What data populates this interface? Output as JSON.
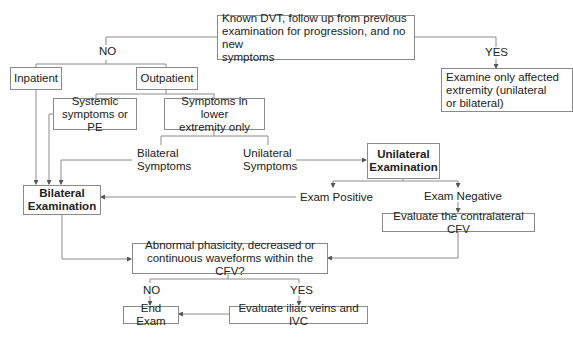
{
  "diagram": {
    "type": "flowchart",
    "nodes": {
      "start": "Known DVT, follow up from previous examination for progression, and no new symptoms",
      "inpatient": "Inpatient",
      "outpatient": "Outpatient",
      "systemic": "Systemic symptoms or PE",
      "lower_extremity": "Symptoms in lower extremity only",
      "affected_only": "Examine only affected extremity (unilateral or bilateral)",
      "unilateral_exam": "Unilateral Examination",
      "bilateral_exam": "Bilateral Examination",
      "contralateral_cfv": "Evaluate the contralateral CFV",
      "abnormal_question": "Abnormal phasicity, decreased or continuous waveforms within the CFV?",
      "end_exam": "End Exam",
      "iliac_ivc": "Evaluate iliac veins and IVC"
    },
    "labels": {
      "no_top": "NO",
      "yes_top": "YES",
      "bilateral_symptoms": "Bilateral Symptoms",
      "unilateral_symptoms": "Unilateral Symptoms",
      "exam_positive": "Exam Positive",
      "exam_negative": "Exam Negative",
      "no_bottom": "NO",
      "yes_bottom": "YES"
    },
    "lines": {
      "start_l1": "Known DVT, follow up from previous",
      "start_l2": "examination for progression, and no new",
      "start_l3": "symptoms",
      "systemic_l1": "Systemic",
      "systemic_l2": "symptoms or PE",
      "lower_l1": "Symptoms in lower",
      "lower_l2": "extremity only",
      "affected_l1": "Examine only affected",
      "affected_l2": "extremity (unilateral",
      "affected_l3": "or bilateral)",
      "uni_l1": "Unilateral",
      "uni_l2": "Examination",
      "bi_l1": "Bilateral",
      "bi_l2": "Examination",
      "abn_l1": "Abnormal phasicity, decreased or",
      "abn_l2": "continuous waveforms within the CFV?",
      "bisym_l1": "Bilateral",
      "bisym_l2": "Symptoms",
      "unisym_l1": "Unilateral",
      "unisym_l2": "Symptoms"
    },
    "line_color": "#8a8a8a"
  }
}
